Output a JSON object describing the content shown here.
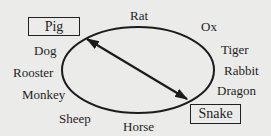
{
  "diagram": {
    "type": "zodiac-cycle",
    "boxed": [
      "Pig",
      "Snake"
    ],
    "labels": {
      "pig": "Pig",
      "rat": "Rat",
      "ox": "Ox",
      "tiger": "Tiger",
      "rabbit": "Rabbit",
      "dragon": "Dragon",
      "snake": "Snake",
      "horse": "Horse",
      "sheep": "Sheep",
      "monkey": "Monkey",
      "rooster": "Rooster",
      "dog": "Dog"
    },
    "arrow": {
      "from": "Pig",
      "to": "Snake",
      "style": "double-headed"
    },
    "colors": {
      "background": "#ebebea",
      "ink": "#1c1c1c"
    }
  }
}
